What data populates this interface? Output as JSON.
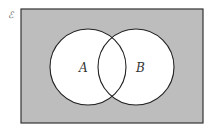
{
  "diagram": {
    "type": "venn",
    "universal_label": "ℰ",
    "sets": [
      {
        "label": "A",
        "cx": 88,
        "cy": 67,
        "r": 38
      },
      {
        "label": "B",
        "cx": 136,
        "cy": 67,
        "r": 38
      }
    ],
    "shaded_region": "outside A ∪ B",
    "colors": {
      "shade": "#bdbdbd",
      "circle_fill": "#ffffff",
      "stroke": "#222222"
    }
  }
}
